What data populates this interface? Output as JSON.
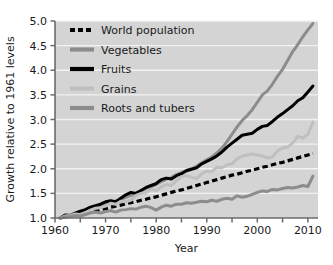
{
  "chart_data": {
    "type": "line",
    "title": "",
    "xlabel": "Year",
    "ylabel": "Growth relative to 1961 levels",
    "xlim": [
      1960,
      2012
    ],
    "ylim": [
      1.0,
      5.0
    ],
    "grid": true,
    "grid_axis": "y",
    "legend_position": "upper left",
    "xticks": [
      1960,
      1970,
      1980,
      1990,
      2000,
      2010
    ],
    "xtick_labels": [
      "1960",
      "1970",
      "1980",
      "1990",
      "2000",
      "2010"
    ],
    "xminor_ticks": [
      1965,
      1975,
      1985,
      1995,
      2005
    ],
    "yticks": [
      1.0,
      1.5,
      2.0,
      2.5,
      3.0,
      3.5,
      4.0,
      4.5,
      5.0
    ],
    "ytick_labels": [
      "1.0",
      "1.5",
      "2.0",
      "2.5",
      "3.0",
      "3.5",
      "4.0",
      "4.5",
      "5.0"
    ],
    "plot_bgcolor": "#d4d4d4",
    "grid_color": "#f2f2f2",
    "x": [
      1961,
      1962,
      1963,
      1964,
      1965,
      1966,
      1967,
      1968,
      1969,
      1970,
      1971,
      1972,
      1973,
      1974,
      1975,
      1976,
      1977,
      1978,
      1979,
      1980,
      1981,
      1982,
      1983,
      1984,
      1985,
      1986,
      1987,
      1988,
      1989,
      1990,
      1991,
      1992,
      1993,
      1994,
      1995,
      1996,
      1997,
      1998,
      1999,
      2000,
      2001,
      2002,
      2003,
      2004,
      2005,
      2006,
      2007,
      2008,
      2009,
      2010,
      2011
    ],
    "series": [
      {
        "name": "World population",
        "color": "#000000",
        "style": "dashed",
        "width": 3.2,
        "values": [
          1.0,
          1.02,
          1.04,
          1.06,
          1.08,
          1.1,
          1.12,
          1.14,
          1.17,
          1.19,
          1.22,
          1.24,
          1.26,
          1.29,
          1.31,
          1.33,
          1.36,
          1.38,
          1.41,
          1.43,
          1.46,
          1.49,
          1.52,
          1.55,
          1.57,
          1.6,
          1.63,
          1.66,
          1.69,
          1.72,
          1.75,
          1.78,
          1.81,
          1.84,
          1.87,
          1.89,
          1.92,
          1.95,
          1.97,
          2.0,
          2.03,
          2.05,
          2.08,
          2.11,
          2.13,
          2.16,
          2.19,
          2.22,
          2.25,
          2.28,
          2.31
        ]
      },
      {
        "name": "Vegetables",
        "color": "#8c8c8c",
        "style": "solid",
        "width": 3.0,
        "values": [
          1.0,
          1.03,
          1.06,
          1.1,
          1.13,
          1.16,
          1.2,
          1.23,
          1.26,
          1.29,
          1.31,
          1.34,
          1.38,
          1.42,
          1.46,
          1.5,
          1.55,
          1.6,
          1.64,
          1.68,
          1.74,
          1.79,
          1.82,
          1.88,
          1.92,
          1.97,
          2.0,
          2.05,
          2.12,
          2.18,
          2.24,
          2.32,
          2.42,
          2.55,
          2.7,
          2.85,
          2.98,
          3.08,
          3.2,
          3.35,
          3.5,
          3.58,
          3.72,
          3.88,
          4.02,
          4.2,
          4.38,
          4.52,
          4.68,
          4.82,
          4.95
        ]
      },
      {
        "name": "Fruits",
        "color": "#000000",
        "style": "solid",
        "width": 3.0,
        "values": [
          1.0,
          1.06,
          1.05,
          1.1,
          1.14,
          1.17,
          1.22,
          1.25,
          1.28,
          1.33,
          1.35,
          1.33,
          1.4,
          1.47,
          1.52,
          1.5,
          1.56,
          1.62,
          1.66,
          1.7,
          1.78,
          1.81,
          1.79,
          1.86,
          1.9,
          1.96,
          1.99,
          2.02,
          2.1,
          2.15,
          2.2,
          2.26,
          2.34,
          2.44,
          2.52,
          2.6,
          2.68,
          2.7,
          2.72,
          2.8,
          2.86,
          2.88,
          2.96,
          3.05,
          3.12,
          3.2,
          3.28,
          3.38,
          3.44,
          3.56,
          3.68
        ]
      },
      {
        "name": "Grains",
        "color": "#bfbfbf",
        "style": "solid",
        "width": 3.0,
        "values": [
          1.0,
          1.04,
          1.05,
          1.08,
          1.07,
          1.11,
          1.16,
          1.2,
          1.21,
          1.24,
          1.3,
          1.28,
          1.34,
          1.33,
          1.36,
          1.46,
          1.5,
          1.52,
          1.58,
          1.56,
          1.63,
          1.68,
          1.66,
          1.76,
          1.84,
          1.86,
          1.83,
          1.8,
          1.9,
          1.95,
          1.94,
          2.03,
          2.02,
          2.08,
          2.1,
          2.2,
          2.26,
          2.28,
          2.3,
          2.28,
          2.26,
          2.22,
          2.24,
          2.36,
          2.42,
          2.44,
          2.52,
          2.66,
          2.62,
          2.7,
          2.95
        ]
      },
      {
        "name": "Roots and tubers",
        "color": "#8c8c8c",
        "style": "solid",
        "width": 3.0,
        "values": [
          1.0,
          1.02,
          1.03,
          1.05,
          1.04,
          1.07,
          1.1,
          1.12,
          1.1,
          1.13,
          1.15,
          1.12,
          1.16,
          1.17,
          1.19,
          1.18,
          1.22,
          1.24,
          1.21,
          1.16,
          1.22,
          1.26,
          1.24,
          1.28,
          1.28,
          1.31,
          1.3,
          1.32,
          1.34,
          1.33,
          1.36,
          1.34,
          1.38,
          1.4,
          1.38,
          1.45,
          1.42,
          1.44,
          1.48,
          1.52,
          1.55,
          1.54,
          1.58,
          1.57,
          1.6,
          1.62,
          1.61,
          1.63,
          1.66,
          1.64,
          1.85
        ]
      }
    ]
  },
  "legend": {
    "items": [
      {
        "label": "World population"
      },
      {
        "label": "Vegetables"
      },
      {
        "label": "Fruits"
      },
      {
        "label": "Grains"
      },
      {
        "label": "Roots and tubers"
      }
    ]
  }
}
